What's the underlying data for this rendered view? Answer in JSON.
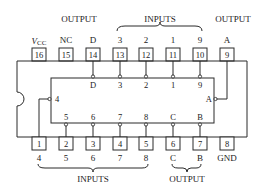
{
  "diagram": {
    "type": "IC pinout (16-pin DIP, 9-bit priority encoder style)",
    "top_group_labels": [
      {
        "text": "OUTPUT",
        "x": 79
      },
      {
        "text": "INPUTS",
        "x": 160
      },
      {
        "text": "OUTPUT",
        "x": 233
      }
    ],
    "bottom_group_labels": [
      {
        "text": "INPUTS",
        "x": 93
      },
      {
        "text": "OUTPUT",
        "x": 187
      }
    ],
    "top_pins": [
      {
        "num": "16",
        "label": "VCC",
        "x": 39
      },
      {
        "num": "15",
        "label": "NC",
        "x": 66
      },
      {
        "num": "14",
        "label": "D",
        "x": 93
      },
      {
        "num": "13",
        "label": "3",
        "x": 120
      },
      {
        "num": "12",
        "label": "2",
        "x": 146
      },
      {
        "num": "11",
        "label": "1",
        "x": 173
      },
      {
        "num": "10",
        "label": "9",
        "x": 200
      },
      {
        "num": "9",
        "label": "A",
        "x": 227
      }
    ],
    "bottom_pins": [
      {
        "num": "1",
        "label": "4",
        "x": 39
      },
      {
        "num": "2",
        "label": "5",
        "x": 66
      },
      {
        "num": "3",
        "label": "6",
        "x": 93
      },
      {
        "num": "4",
        "label": "7",
        "x": 120
      },
      {
        "num": "5",
        "label": "8",
        "x": 146
      },
      {
        "num": "6",
        "label": "C",
        "x": 173
      },
      {
        "num": "7",
        "label": "B",
        "x": 200
      },
      {
        "num": "8",
        "label": "GND",
        "x": 227
      }
    ],
    "inner_top_labels": [
      "D",
      "3",
      "2",
      "1",
      "9"
    ],
    "inner_bottom_labels": [
      "5",
      "6",
      "7",
      "8",
      "C",
      "B"
    ],
    "inner_left_label": "4",
    "inner_right_label": "A",
    "vcc": {
      "main": "V",
      "sub": "CC"
    }
  }
}
